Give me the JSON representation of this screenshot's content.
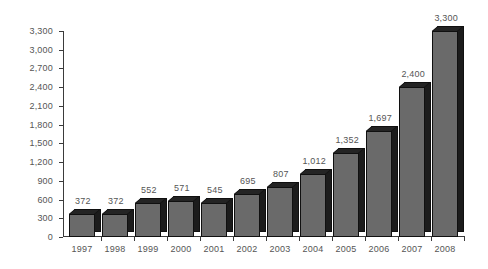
{
  "chart_data": {
    "type": "bar",
    "title": "",
    "subtitle": "",
    "xlabel": "",
    "ylabel": "",
    "categories": [
      "1997",
      "1998",
      "1999",
      "2000",
      "2001",
      "2002",
      "2003",
      "2004",
      "2005",
      "2006",
      "2007",
      "2008"
    ],
    "values": [
      372,
      372,
      552,
      571,
      545,
      695,
      807,
      1012,
      1352,
      1697,
      2400,
      3300
    ],
    "value_labels": [
      "372",
      "372",
      "552",
      "571",
      "545",
      "695",
      "807",
      "1,012",
      "1,352",
      "1,697",
      "2,400",
      "3,300"
    ],
    "ylim": [
      0,
      3300
    ],
    "y_tick_values": [
      0,
      300,
      600,
      900,
      1200,
      1500,
      1800,
      2100,
      2400,
      2700,
      3000,
      3300
    ],
    "y_tick_labels": [
      "0",
      "300",
      "600",
      "900",
      "1,200",
      "1,500",
      "1,800",
      "2,100",
      "2,400",
      "2,700",
      "3,000",
      "3,300"
    ],
    "grid": false,
    "legend": null,
    "legend_position": "none",
    "annotations": [],
    "style": {
      "bar_front_color": "#6a6a6a",
      "bar_side_color": "#1c1c1c",
      "bar_top_color": "#242424",
      "bar_outline_color": "#101010",
      "text_color": "#555555",
      "axis_color": "#3b3b3b",
      "background_color": "#ffffff",
      "three_d": true
    }
  }
}
